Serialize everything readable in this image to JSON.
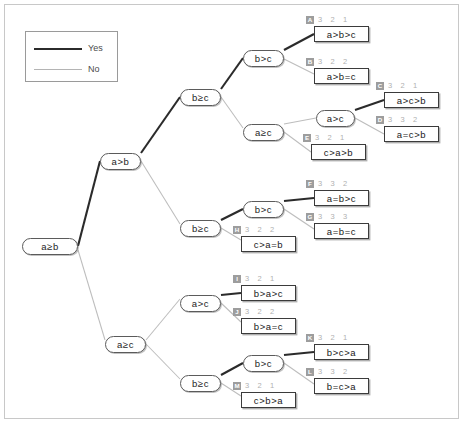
{
  "legend": {
    "yes_label": "Yes",
    "no_label": "No",
    "yes_color": "#2b2b2b",
    "no_color": "#b4b4b4"
  },
  "diagram": {
    "type": "decision-tree",
    "root_test": "a≥b",
    "decision_nodes": [
      {
        "id": "root",
        "label": "a≥b",
        "x": 22,
        "y": 238
      },
      {
        "id": "n1",
        "label": "a>b",
        "x": 100,
        "y": 153
      },
      {
        "id": "n2",
        "label": "b≥c",
        "x": 180,
        "y": 89
      },
      {
        "id": "n3",
        "label": "b>c",
        "x": 243,
        "y": 50
      },
      {
        "id": "n4",
        "label": "a≥c",
        "x": 243,
        "y": 124
      },
      {
        "id": "n5",
        "label": "a>c",
        "x": 316,
        "y": 110
      },
      {
        "id": "n6",
        "label": "b≥c",
        "x": 180,
        "y": 220
      },
      {
        "id": "n7",
        "label": "b>c",
        "x": 243,
        "y": 201
      },
      {
        "id": "n8",
        "label": "a≥c",
        "x": 105,
        "y": 336
      },
      {
        "id": "n9",
        "label": "a>c",
        "x": 180,
        "y": 295
      },
      {
        "id": "n10",
        "label": "b≥c",
        "x": 180,
        "y": 375
      },
      {
        "id": "n11",
        "label": "b>c",
        "x": 243,
        "y": 355
      }
    ],
    "leaves": [
      {
        "badge": "A",
        "ranks": "3  2  1",
        "label": "a>b>c",
        "x": 314,
        "y": 26,
        "hx": 306,
        "hy": 14
      },
      {
        "badge": "B",
        "ranks": "3  2  2",
        "label": "a>b=c",
        "x": 314,
        "y": 68,
        "hx": 306,
        "hy": 56
      },
      {
        "badge": "C",
        "ranks": "3  2  1",
        "label": "a>c>b",
        "x": 384,
        "y": 92,
        "hx": 376,
        "hy": 80
      },
      {
        "badge": "D",
        "ranks": "3  3  2",
        "label": "a=c>b",
        "x": 384,
        "y": 126,
        "hx": 376,
        "hy": 114
      },
      {
        "badge": "E",
        "ranks": "3  2  1",
        "label": "c>a>b",
        "x": 311,
        "y": 144,
        "hx": 303,
        "hy": 132
      },
      {
        "badge": "F",
        "ranks": "3  3  2",
        "label": "a=b>c",
        "x": 314,
        "y": 190,
        "hx": 306,
        "hy": 178
      },
      {
        "badge": "G",
        "ranks": "3  3  3",
        "label": "a=b=c",
        "x": 314,
        "y": 223,
        "hx": 306,
        "hy": 211
      },
      {
        "badge": "H",
        "ranks": "3  2  2",
        "label": "c>a=b",
        "x": 241,
        "y": 236,
        "hx": 233,
        "hy": 224
      },
      {
        "badge": "I",
        "ranks": "3  2  1",
        "label": "b>a>c",
        "x": 241,
        "y": 285,
        "hx": 233,
        "hy": 273
      },
      {
        "badge": "J",
        "ranks": "3  2  2",
        "label": "b>a=c",
        "x": 241,
        "y": 318,
        "hx": 233,
        "hy": 306
      },
      {
        "badge": "K",
        "ranks": "3  2  1",
        "label": "b>c>a",
        "x": 314,
        "y": 344,
        "hx": 306,
        "hy": 332
      },
      {
        "badge": "L",
        "ranks": "3  3  2",
        "label": "b=c>a",
        "x": 314,
        "y": 378,
        "hx": 306,
        "hy": 366
      },
      {
        "badge": "M",
        "ranks": "3  2  1",
        "label": "c>b>a",
        "x": 241,
        "y": 392,
        "hx": 233,
        "hy": 380
      }
    ]
  }
}
